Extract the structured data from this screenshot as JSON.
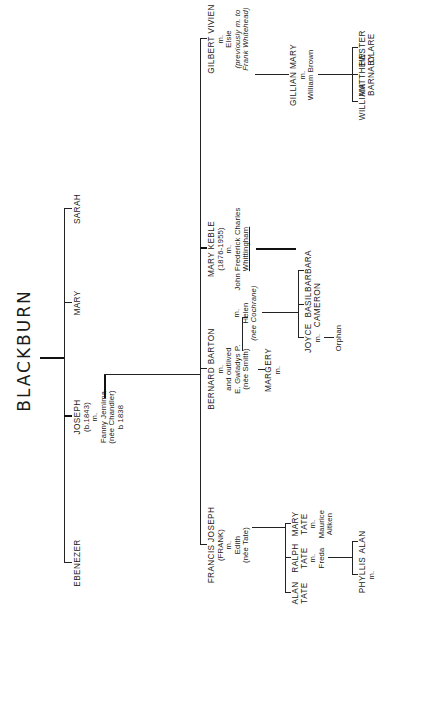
{
  "title": "BLACKBURN",
  "generation1": {
    "siblings": [
      {
        "name": "EBENEZER"
      },
      {
        "name": "JOSEPH",
        "dates": "(b.1843)",
        "marriage": "m.",
        "spouse": "Fanny Jemima",
        "spouse_nee": "(née Chandler)",
        "spouse_dates": "b 1838"
      },
      {
        "name": "MARY"
      },
      {
        "name": "SARAH"
      }
    ]
  },
  "generation2": {
    "children_of_joseph": [
      {
        "name": "FRANCIS JOSEPH",
        "alias": "(FRANK)",
        "marriage": "m.",
        "spouse": "Edith",
        "spouse_nee": "(née Tate)"
      },
      {
        "name": "BERNARD BARTON",
        "marriage": "m.",
        "note": "and outlived",
        "spouse": "E. Gwladys P.",
        "spouse_nee": "(née Smith)",
        "marriage2": "m.",
        "spouse2": "Helen",
        "spouse2_nee": "(née Cochrane)"
      },
      {
        "name": "MARY KEBLE",
        "dates": "(1876-1955)",
        "marriage": "m.",
        "spouse_line1": "John Frederick Charles",
        "spouse_line2": "Whittingham"
      },
      {
        "name": "GILBERT VIVIEN",
        "marriage": "m.",
        "spouse": "Elsie",
        "spouse_note1": "(previously m. to",
        "spouse_note2": "Frank Whitehead)"
      }
    ]
  },
  "generation3": {
    "children_of_frank": [
      {
        "name_line1": "ALAN",
        "name_line2": "TATE"
      },
      {
        "name_line1": "RALPH",
        "name_line2": "TATE",
        "marriage": "m.",
        "spouse": "Freda"
      },
      {
        "name_line1": "MARY",
        "name_line2": "TATE",
        "marriage": "m.",
        "spouse_line1": "Maurice",
        "spouse_line2": "Aitken"
      }
    ],
    "child_of_bernard_first": {
      "name": "MARGERY",
      "marriage": "m."
    },
    "children_of_bernard_helen": [
      {
        "name": "JOYCE",
        "marriage": "m.",
        "spouse": "Orphan"
      },
      {
        "name_line1": "BASIL",
        "name_line2": "CAMERON"
      },
      {
        "name": "BARBARA"
      }
    ],
    "children_of_gilbert": [
      {
        "name": "GILLIAN MARY",
        "marriage": "m.",
        "spouse": "William Brown"
      }
    ]
  },
  "generation4": {
    "children_of_ralph": [
      {
        "name": "PHYLLIS",
        "marriage": "m."
      },
      {
        "name": "ALAN"
      }
    ],
    "children_of_gillian": [
      {
        "name": "WILLIAM"
      },
      {
        "name_line1": "MATTHEW",
        "name_line2": "BARNABY"
      },
      {
        "name_line1": "HESTER",
        "name_line2": "CLARE"
      }
    ]
  }
}
